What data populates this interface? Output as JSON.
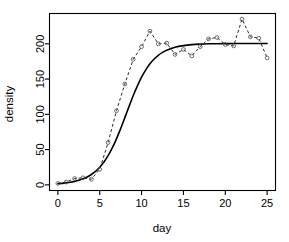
{
  "chart_data": {
    "type": "scatter",
    "title": "",
    "xlabel": "day",
    "ylabel": "density",
    "xlim": [
      -1.0,
      26.0
    ],
    "ylim": [
      -8,
      243
    ],
    "xticks": [
      0,
      5,
      10,
      15,
      20,
      25
    ],
    "yticks": [
      0,
      50,
      100,
      150,
      200
    ],
    "xtick_labels": [
      "0",
      "5",
      "10",
      "15",
      "20",
      "25"
    ],
    "ytick_labels": [
      "0",
      "50",
      "100",
      "150",
      "200"
    ],
    "grid": false,
    "legend": null,
    "box": "full-rectangle",
    "series": [
      {
        "name": "observed",
        "style": "open-circle markers joined by dashed line",
        "marker": "circle-open",
        "linestyle": "dashed",
        "color": "#555555",
        "x": [
          0,
          1,
          2,
          3,
          4,
          5,
          6,
          7,
          8,
          9,
          10,
          11,
          12,
          13,
          14,
          15,
          16,
          17,
          18,
          19,
          20,
          21,
          22,
          23,
          24,
          25
        ],
        "y": [
          2,
          4,
          9,
          10,
          8,
          22,
          60,
          105,
          143,
          178,
          196,
          218,
          200,
          201,
          185,
          192,
          183,
          196,
          207,
          209,
          199,
          197,
          235,
          210,
          208,
          180
        ]
      },
      {
        "name": "logistic fit",
        "style": "solid curve",
        "marker": "none",
        "linestyle": "solid",
        "color": "#000000",
        "x": [
          0,
          0.5,
          1,
          1.5,
          2,
          2.5,
          3,
          3.5,
          4,
          4.5,
          5,
          5.5,
          6,
          6.5,
          7,
          7.5,
          8,
          8.5,
          9,
          9.5,
          10,
          10.5,
          11,
          11.5,
          12,
          12.5,
          13,
          14,
          15,
          16,
          17,
          18,
          19,
          20,
          21,
          22,
          23,
          24,
          25
        ],
        "y": [
          1.6,
          2.1,
          2.8,
          3.7,
          4.9,
          6.4,
          8.5,
          11.2,
          14.7,
          19.2,
          25.0,
          32.3,
          41.4,
          52.4,
          65.3,
          79.8,
          95.3,
          111.1,
          126.4,
          140.4,
          152.7,
          163.1,
          171.6,
          178.4,
          183.7,
          187.8,
          190.9,
          195.1,
          197.5,
          198.9,
          199.6,
          200.0,
          200.2,
          200.3,
          200.4,
          200.4,
          200.4,
          200.4,
          200.4
        ]
      }
    ],
    "annotations": []
  },
  "axes": {
    "x_label": "day",
    "y_label": "density",
    "x_tick_labels": [
      "0",
      "5",
      "10",
      "15",
      "20",
      "25"
    ],
    "y_tick_labels": [
      "0",
      "50",
      "100",
      "150",
      "200"
    ]
  },
  "colors": {
    "background": "#ffffff",
    "axis": "#000000",
    "fit_line": "#000000",
    "observed_line": "#2b2b2b",
    "marker_stroke": "#555555"
  }
}
